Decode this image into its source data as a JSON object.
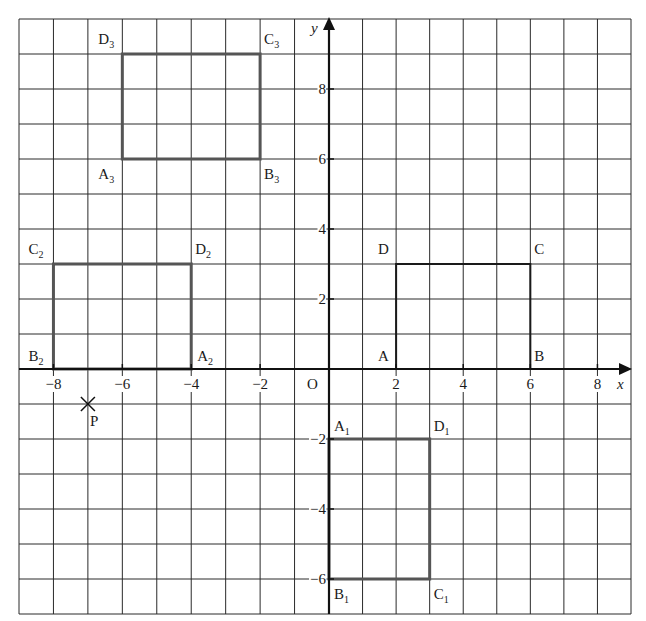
{
  "diagram": {
    "type": "coordinate-grid",
    "grid": {
      "x_min": -9,
      "x_max": 9,
      "y_min": -7,
      "y_max": 10,
      "step": 1,
      "line_color": "#2a2a2a"
    },
    "axes": {
      "x_label": "x",
      "y_label": "y",
      "origin_label": "O",
      "x_ticks": [
        {
          "value": -8,
          "label": "−8"
        },
        {
          "value": -6,
          "label": "−6"
        },
        {
          "value": -4,
          "label": "−4"
        },
        {
          "value": -2,
          "label": "−2"
        },
        {
          "value": 2,
          "label": "2"
        },
        {
          "value": 4,
          "label": "4"
        },
        {
          "value": 6,
          "label": "6"
        },
        {
          "value": 8,
          "label": "8"
        }
      ],
      "y_ticks": [
        {
          "value": 8,
          "label": "8"
        },
        {
          "value": 6,
          "label": "6"
        },
        {
          "value": 4,
          "label": "4"
        },
        {
          "value": 2,
          "label": "2"
        },
        {
          "value": -2,
          "label": "−2"
        },
        {
          "value": -4,
          "label": "−4"
        },
        {
          "value": -6,
          "label": "−6"
        }
      ]
    },
    "rectangles": [
      {
        "name": "ABCD",
        "color": "#1a1a1a",
        "width": 2,
        "vertices": [
          {
            "label": "A",
            "sub": "",
            "x": 2,
            "y": 0,
            "lx": -18,
            "ly": -8
          },
          {
            "label": "B",
            "sub": "",
            "x": 6,
            "y": 0,
            "lx": 4,
            "ly": -8
          },
          {
            "label": "C",
            "sub": "",
            "x": 6,
            "y": 3,
            "lx": 4,
            "ly": -10
          },
          {
            "label": "D",
            "sub": "",
            "x": 2,
            "y": 3,
            "lx": -18,
            "ly": -10
          }
        ]
      },
      {
        "name": "A1B1C1D1",
        "color": "#555555",
        "width": 3,
        "vertices": [
          {
            "label": "A",
            "sub": "1",
            "x": 0,
            "y": -2,
            "lx": 5,
            "ly": -8
          },
          {
            "label": "B",
            "sub": "1",
            "x": 0,
            "y": -6,
            "lx": 5,
            "ly": 20
          },
          {
            "label": "C",
            "sub": "1",
            "x": 3,
            "y": -6,
            "lx": 4,
            "ly": 20
          },
          {
            "label": "D",
            "sub": "1",
            "x": 3,
            "y": -2,
            "lx": 4,
            "ly": -8
          }
        ]
      },
      {
        "name": "A2B2C2D2",
        "color": "#555555",
        "width": 3,
        "vertices": [
          {
            "label": "A",
            "sub": "2",
            "x": -4,
            "y": 0,
            "lx": 6,
            "ly": -8
          },
          {
            "label": "B",
            "sub": "2",
            "x": -8,
            "y": 0,
            "lx": -25,
            "ly": -8
          },
          {
            "label": "C",
            "sub": "2",
            "x": -8,
            "y": 3,
            "lx": -25,
            "ly": -10
          },
          {
            "label": "D",
            "sub": "2",
            "x": -4,
            "y": 3,
            "lx": 4,
            "ly": -10
          }
        ]
      },
      {
        "name": "A3B3C3D3",
        "color": "#555555",
        "width": 3,
        "vertices": [
          {
            "label": "A",
            "sub": "3",
            "x": -6,
            "y": 6,
            "lx": -24,
            "ly": 20
          },
          {
            "label": "B",
            "sub": "3",
            "x": -2,
            "y": 6,
            "lx": 4,
            "ly": 20
          },
          {
            "label": "C",
            "sub": "3",
            "x": -2,
            "y": 9,
            "lx": 4,
            "ly": -10
          },
          {
            "label": "D",
            "sub": "3",
            "x": -6,
            "y": 9,
            "lx": -24,
            "ly": -10
          }
        ]
      }
    ],
    "points": [
      {
        "label": "P",
        "x": -7,
        "y": -1,
        "marker": "cross"
      }
    ]
  }
}
